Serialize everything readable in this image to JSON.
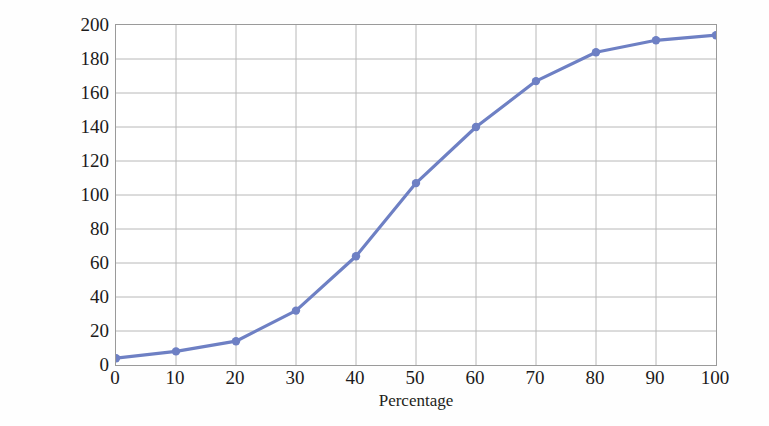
{
  "chart_data": {
    "type": "line",
    "title": "",
    "xlabel": "Percentage",
    "ylabel": "Cumulative frequency",
    "x": [
      0,
      10,
      20,
      30,
      40,
      50,
      60,
      70,
      80,
      90,
      100
    ],
    "values": [
      4,
      8,
      14,
      32,
      64,
      107,
      140,
      167,
      184,
      191,
      194
    ],
    "series": [
      {
        "name": "Cumulative frequency",
        "values": [
          4,
          8,
          14,
          32,
          64,
          107,
          140,
          167,
          184,
          191,
          194
        ]
      }
    ],
    "xlim": [
      0,
      100
    ],
    "ylim": [
      0,
      200
    ],
    "xticks": [
      0,
      10,
      20,
      30,
      40,
      50,
      60,
      70,
      80,
      90,
      100
    ],
    "yticks": [
      0,
      20,
      40,
      60,
      80,
      100,
      120,
      140,
      160,
      180,
      200
    ],
    "xtick_labels": [
      "0",
      "10",
      "20",
      "30",
      "40",
      "50",
      "60",
      "70",
      "80",
      "90",
      "100"
    ],
    "ytick_labels": [
      "0",
      "20",
      "40",
      "60",
      "80",
      "100",
      "120",
      "140",
      "160",
      "180",
      "200"
    ],
    "grid": true,
    "legend": false,
    "markers": true,
    "line_color": "#6e80c4",
    "marker_color": "#6e80c4",
    "grid_color": "#b8b8b8",
    "axis_color": "#9a9a9a",
    "background_color": "#ffffff"
  }
}
